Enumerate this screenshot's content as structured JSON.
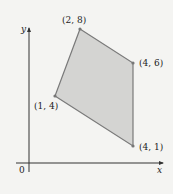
{
  "figure": {
    "origin_label": "0",
    "x_axis_label": "x",
    "y_axis_label": "y",
    "fill_color": "#d4d4d2",
    "edge_color": "#7a7a7a",
    "axis_color": "#333333",
    "vertices": [
      {
        "label": "(2, 8)",
        "x": 2,
        "y": 8
      },
      {
        "label": "(4, 6)",
        "x": 4,
        "y": 6
      },
      {
        "label": "(4, 1)",
        "x": 4,
        "y": 1
      },
      {
        "label": "(1, 4)",
        "x": 1,
        "y": 4
      }
    ]
  }
}
